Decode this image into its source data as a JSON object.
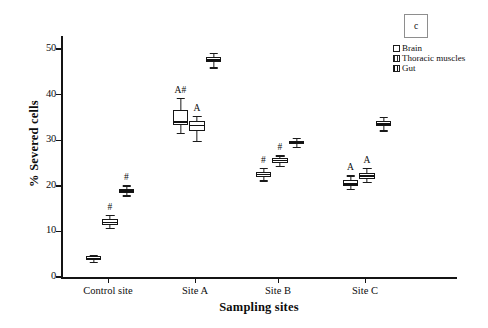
{
  "panel": {
    "tag": "c"
  },
  "legend": {
    "entries": [
      {
        "label": "Brain",
        "pattern": "open-white"
      },
      {
        "label": "Thoracic muscles",
        "pattern": "light-vertical-hatch"
      },
      {
        "label": "Gut",
        "pattern": "dense-vertical-hatch"
      }
    ]
  },
  "chart_data": {
    "type": "box",
    "title": "",
    "xlabel": "Sampling sites",
    "ylabel": "% Severed cells",
    "categories": [
      "Control site",
      "Site A",
      "Site B",
      "Site C"
    ],
    "ylim": [
      0,
      52
    ],
    "yticks": [
      0,
      10,
      20,
      30,
      40,
      50
    ],
    "grid": false,
    "legend_position": "top-right",
    "series": [
      {
        "name": "Brain",
        "pattern": "open-white",
        "boxes": [
          {
            "category": "Control site",
            "whisker_low": 3.3,
            "q1": 3.8,
            "median": 4.1,
            "q3": 4.5,
            "whisker_high": 4.9,
            "annotation": ""
          },
          {
            "category": "Site A",
            "whisker_low": 31.6,
            "q1": 33.4,
            "median": 34.0,
            "q3": 36.6,
            "whisker_high": 39.3,
            "annotation": "A#"
          },
          {
            "category": "Site B",
            "whisker_low": 21.2,
            "q1": 22.0,
            "median": 22.5,
            "q3": 23.1,
            "whisker_high": 23.9,
            "annotation": "#"
          },
          {
            "category": "Site C",
            "whisker_low": 19.3,
            "q1": 20.0,
            "median": 20.4,
            "q3": 21.3,
            "whisker_high": 22.3,
            "annotation": "A"
          }
        ]
      },
      {
        "name": "Thoracic muscles",
        "pattern": "light-vertical-hatch",
        "boxes": [
          {
            "category": "Control site",
            "whisker_low": 10.8,
            "q1": 11.5,
            "median": 12.0,
            "q3": 12.7,
            "whisker_high": 13.6,
            "annotation": "#"
          },
          {
            "category": "Site A",
            "whisker_low": 29.9,
            "q1": 32.0,
            "median": 33.2,
            "q3": 34.3,
            "whisker_high": 35.4,
            "annotation": "A"
          },
          {
            "category": "Site B",
            "whisker_low": 24.4,
            "q1": 25.1,
            "median": 25.6,
            "q3": 26.1,
            "whisker_high": 26.7,
            "annotation": "#"
          },
          {
            "category": "Site C",
            "whisker_low": 20.8,
            "q1": 21.6,
            "median": 22.2,
            "q3": 22.8,
            "whisker_high": 24.0,
            "annotation": "A"
          }
        ]
      },
      {
        "name": "Gut",
        "pattern": "dense-vertical-hatch",
        "boxes": [
          {
            "category": "Control site",
            "whisker_low": 17.9,
            "q1": 18.5,
            "median": 18.9,
            "q3": 19.4,
            "whisker_high": 20.1,
            "annotation": "#"
          },
          {
            "category": "Site A",
            "whisker_low": 46.0,
            "q1": 47.2,
            "median": 47.6,
            "q3": 48.2,
            "whisker_high": 49.2,
            "annotation": ""
          },
          {
            "category": "Site B",
            "whisker_low": 28.6,
            "q1": 29.2,
            "median": 29.5,
            "q3": 29.9,
            "whisker_high": 30.5,
            "annotation": ""
          },
          {
            "category": "Site C",
            "whisker_low": 32.2,
            "q1": 33.1,
            "median": 33.6,
            "q3": 34.2,
            "whisker_high": 35.2,
            "annotation": ""
          }
        ]
      }
    ]
  }
}
